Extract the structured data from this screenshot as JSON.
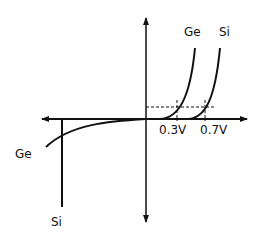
{
  "diagram": {
    "labels": {
      "ge_forward": "Ge",
      "si_forward": "Si",
      "ge_reverse": "Ge",
      "si_reverse": "Si",
      "ge_knee": "0.3V",
      "si_knee": "0.7V"
    },
    "colors": {
      "line": "#111111",
      "background": "#ffffff"
    }
  }
}
